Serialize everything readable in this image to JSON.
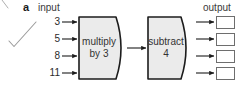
{
  "figure": {
    "part_label": "a",
    "input_heading": "input",
    "output_heading": "output"
  },
  "inputs": [
    {
      "value": "3"
    },
    {
      "value": "5"
    },
    {
      "value": "8"
    },
    {
      "value": "11"
    }
  ],
  "machines": [
    {
      "line1": "multiply",
      "line2": "by 3"
    },
    {
      "line1": "subtract",
      "line2": "4"
    }
  ],
  "outputs": [
    {
      "value": ""
    },
    {
      "value": ""
    },
    {
      "value": ""
    },
    {
      "value": ""
    }
  ],
  "annotation": {
    "mark": "check-mark",
    "color": "#9a9a9a"
  },
  "colors": {
    "machine_fill": "#ebebeb",
    "machine_stroke": "#1c1c1c",
    "arrow": "#1c1c1c",
    "box_stroke": "#6e6e6e",
    "text": "#2b2b2b"
  }
}
